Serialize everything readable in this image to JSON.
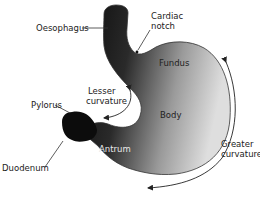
{
  "diagram": {
    "labels": {
      "oesophagus": "Oesophagus",
      "cardiac_notch_line1": "Cardiac",
      "cardiac_notch_line2": "notch",
      "fundus": "Fundus",
      "lesser_curvature_line1": "Lesser",
      "lesser_curvature_line2": "curvature",
      "pylorus": "Pylorus",
      "body": "Body",
      "antrum": "Antrum",
      "duodenum": "Duodenum",
      "greater_curvature_line1": "Greater",
      "greater_curvature_line2": "curvature"
    },
    "colors": {
      "organ_dark": "#111111",
      "organ_light": "#d8d8d8",
      "outline": "#333333",
      "leader_line": "#333333",
      "text": "#222222",
      "text_on_dark": "#e8e8e8",
      "background": "#ffffff"
    }
  }
}
